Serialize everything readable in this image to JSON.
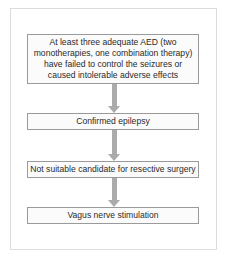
{
  "diagram": {
    "type": "flowchart",
    "direction": "top-to-bottom",
    "colors": {
      "frame_border": "#dcdcdc",
      "box_border": "#9a9a9a",
      "box_fill": "#fbfbfb",
      "arrow": "#ababab",
      "text": "#2a2a2a"
    },
    "steps": [
      {
        "label": "At least three adequate AED (two monotherapies, one combination therapy) have failed to control the seizures or caused intolerable adverse effects"
      },
      {
        "label": "Confirmed epilepsy"
      },
      {
        "label": "Not suitable candidate for resective surgery"
      },
      {
        "label": "Vagus nerve stimulation"
      }
    ],
    "connections": [
      {
        "from": 0,
        "to": 1
      },
      {
        "from": 1,
        "to": 2
      },
      {
        "from": 2,
        "to": 3
      }
    ]
  }
}
